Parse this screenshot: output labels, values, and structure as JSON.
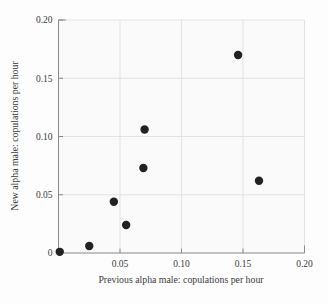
{
  "chart_data": {
    "type": "scatter",
    "title": "",
    "xlabel": "Previous alpha male: copulations per hour",
    "ylabel": "New alpha male: copulations per hour",
    "xlim": [
      0,
      0.2
    ],
    "ylim": [
      0,
      0.2
    ],
    "xticks": [
      0,
      0.05,
      0.1,
      0.15,
      0.2
    ],
    "yticks": [
      0,
      0.05,
      0.1,
      0.15,
      0.2
    ],
    "xtick_labels": [
      "0",
      "0.05",
      "0.10",
      "0.15",
      "0.20"
    ],
    "ytick_labels": [
      "0",
      "0.05",
      "0.10",
      "0.15",
      "0.20"
    ],
    "xtick_labels_shown": [
      "0.05",
      "0.10",
      "0.15",
      "0.20"
    ],
    "grid": true,
    "grid_color": "#e2e2e2",
    "legend": null,
    "marker_color": "#222222",
    "marker_size": 4.2,
    "plot_bg": "#fafafa",
    "axis_color": "#808080",
    "points": [
      {
        "x": 0.001,
        "y": 0.001
      },
      {
        "x": 0.025,
        "y": 0.006
      },
      {
        "x": 0.045,
        "y": 0.044
      },
      {
        "x": 0.055,
        "y": 0.024
      },
      {
        "x": 0.069,
        "y": 0.073
      },
      {
        "x": 0.07,
        "y": 0.106
      },
      {
        "x": 0.146,
        "y": 0.17
      },
      {
        "x": 0.163,
        "y": 0.062
      }
    ]
  }
}
